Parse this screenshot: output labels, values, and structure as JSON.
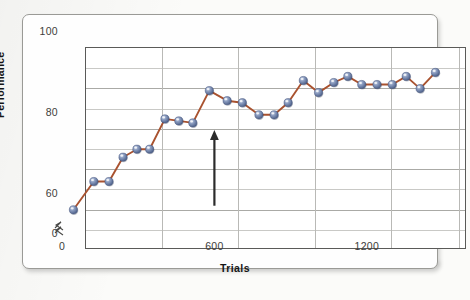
{
  "figure": {
    "kind": "line-graph-figure",
    "axis_break_symbol": "zigzag-break"
  },
  "chart_data": {
    "type": "line",
    "title": "",
    "xlabel": "Trials",
    "ylabel": "Performance",
    "xlim": [
      0,
      1500
    ],
    "ylim": [
      50,
      100
    ],
    "y_axis_break": true,
    "y_axis_break_from": 0,
    "y_axis_break_to": 50,
    "grid": true,
    "grid_axis": "both",
    "legend": "none",
    "xticks": [
      0,
      600,
      1200
    ],
    "xtick_labels": [
      "0",
      "600",
      "1200"
    ],
    "yticks": [
      0,
      60,
      80,
      100
    ],
    "ytick_labels": [
      "0",
      "60",
      "80",
      "100"
    ],
    "y_gridlines": [
      55,
      60,
      65,
      70,
      75,
      80,
      85,
      90,
      95,
      100
    ],
    "x_gridlines": [
      300,
      600,
      900,
      1200,
      1470
    ],
    "series": [
      {
        "name": "Performance across trials",
        "marker": "sphere",
        "marker_color": "#6c82ad",
        "line_color": "#a9522f",
        "x": [
          45,
          125,
          185,
          240,
          295,
          345,
          405,
          460,
          515,
          580,
          650,
          710,
          775,
          835,
          890,
          950,
          1010,
          1070,
          1125,
          1180,
          1240,
          1300,
          1355,
          1410,
          1470
        ],
        "y": [
          56,
          63,
          63,
          69,
          71,
          71,
          78.5,
          78,
          77.5,
          85.5,
          83,
          82.5,
          79.5,
          79.5,
          82.5,
          88,
          85,
          87.5,
          89,
          87,
          87,
          87,
          89,
          86,
          90
        ]
      }
    ],
    "annotations": [
      {
        "kind": "arrow",
        "direction": "up",
        "x": 600,
        "y_tail": 57,
        "y_head": 75,
        "color": "#2b2b2b",
        "label": ""
      }
    ]
  },
  "axes": {
    "y_title": "Performance",
    "x_title": "Trials",
    "y_tick_labels": [
      "100",
      "80",
      "60",
      "0"
    ],
    "x_tick_labels": [
      "0",
      "600",
      "1200"
    ]
  }
}
